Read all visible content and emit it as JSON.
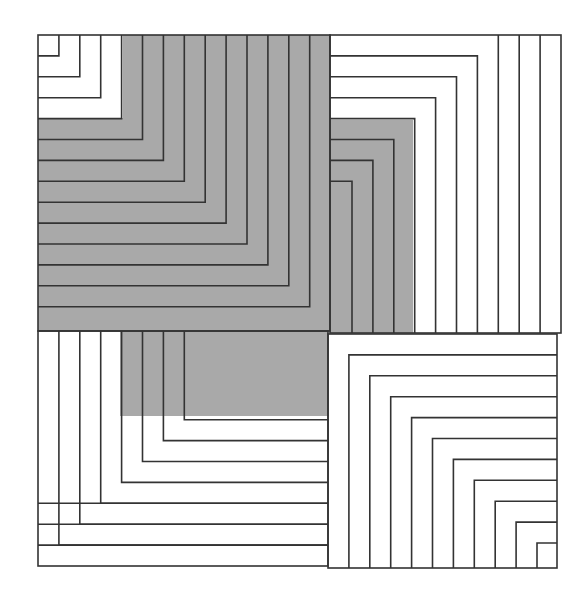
{
  "figure": {
    "colors": {
      "line": "#333333",
      "fill_gray": "#a9a9a9",
      "background": "#ffffff"
    },
    "quadrants": [
      {
        "name": "top-left",
        "x0": 38,
        "y0": 35,
        "x1": 330,
        "y1": 331,
        "corner": "bottom-right",
        "nested_lines": 14,
        "gray_from_line": 4
      },
      {
        "name": "top-right",
        "x0": 330,
        "y0": 35,
        "x1": 561,
        "y1": 333,
        "corner": "bottom-left",
        "nested_lines": 10,
        "gray_from_line": 7
      },
      {
        "name": "bottom-left",
        "x0": 38,
        "y0": 331,
        "x1": 328,
        "y1": 566,
        "corner": "top-right",
        "nested_lines": 10,
        "gray_from_line": 7
      },
      {
        "name": "bottom-right",
        "x0": 328,
        "y0": 334,
        "x1": 557,
        "y1": 568,
        "corner": "top-left",
        "nested_lines": 10,
        "gray_from_line": null
      }
    ]
  }
}
